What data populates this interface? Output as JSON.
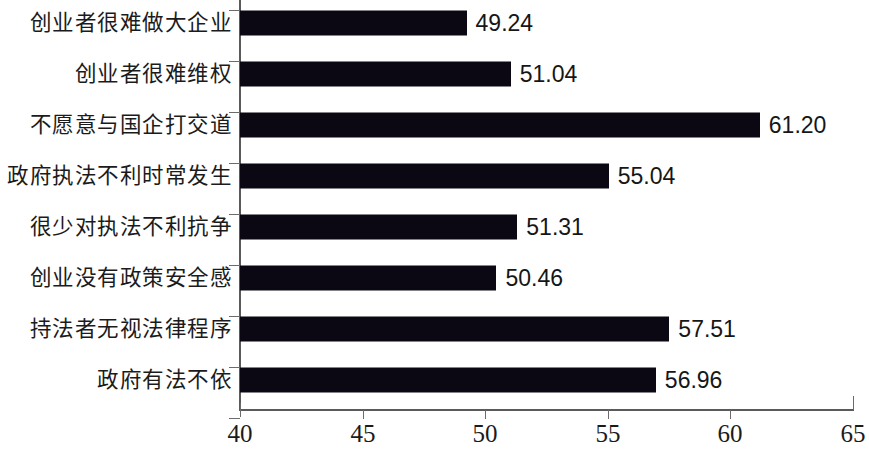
{
  "chart_data": {
    "type": "bar",
    "orientation": "horizontal",
    "title": "",
    "subtitle": "",
    "xlabel": "",
    "ylabel": "",
    "xlim": [
      40,
      65
    ],
    "xticks": [
      40,
      45,
      50,
      55,
      60,
      65
    ],
    "xtick_labels": [
      "40",
      "45",
      "50",
      "55",
      "60",
      "65"
    ],
    "grid": false,
    "legend": "none",
    "bar_color": "#0b0813",
    "axis_color": "#5a5a5a",
    "text_color": "#1b1b1b",
    "categories": [
      "创业者很难做大企业",
      "创业者很难维权",
      "不愿意与国企打交道",
      "政府执法不利时常发生",
      "很少对执法不利抗争",
      "创业没有政策安全感",
      "持法者无视法律程序",
      "政府有法不依"
    ],
    "values": [
      49.24,
      51.04,
      61.2,
      55.04,
      51.31,
      50.46,
      57.51,
      56.96
    ],
    "value_labels": [
      "49.24",
      "51.04",
      "61.20",
      "55.04",
      "51.31",
      "50.46",
      "57.51",
      "56.96"
    ]
  }
}
